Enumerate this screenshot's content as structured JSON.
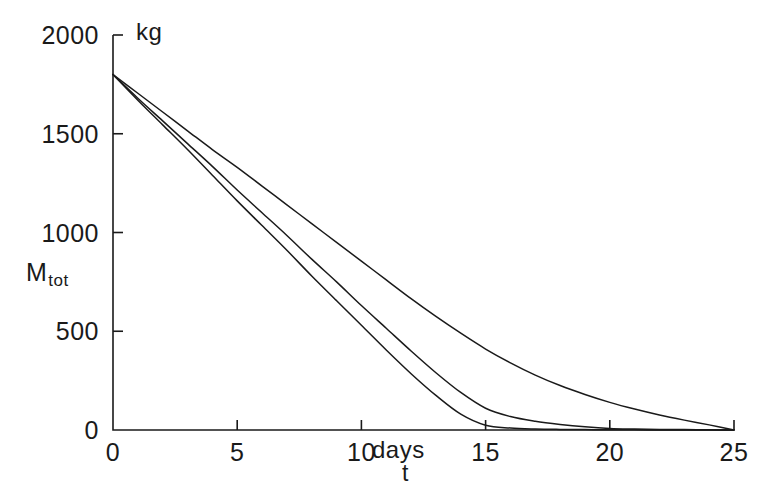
{
  "chart_data": {
    "type": "line",
    "title": "",
    "subtitle": "",
    "xlabel": "t",
    "ylabel": "M_tot",
    "x_unit": "days",
    "y_unit": "kg",
    "xlim": [
      0,
      25
    ],
    "ylim": [
      0,
      2000
    ],
    "x_ticks": [
      0,
      5,
      10,
      15,
      20,
      25
    ],
    "x_tick_labels": [
      "0",
      "5",
      "10",
      "15",
      "20",
      "25"
    ],
    "y_ticks": [
      0,
      500,
      1000,
      1500,
      2000
    ],
    "y_tick_labels": [
      "0",
      "500",
      "1000",
      "1500",
      "2000"
    ],
    "grid": false,
    "legend": "none",
    "line_color": "#1a1a1a",
    "background": "#ffffff",
    "series": [
      {
        "name": "curve-1-slowest",
        "x": [
          0,
          1,
          2,
          3,
          4,
          5,
          6,
          7,
          8,
          9,
          10,
          11,
          12,
          13,
          14,
          15,
          16,
          17,
          18,
          19,
          20,
          21,
          22,
          23,
          24,
          25
        ],
        "values": [
          1800,
          1705,
          1610,
          1515,
          1420,
          1330,
          1235,
          1140,
          1045,
          950,
          855,
          760,
          665,
          575,
          490,
          410,
          340,
          278,
          225,
          180,
          140,
          106,
          76,
          50,
          26,
          0
        ]
      },
      {
        "name": "curve-2-middle",
        "x": [
          0,
          1,
          2,
          3,
          4,
          5,
          6,
          7,
          8,
          9,
          10,
          11,
          12,
          13,
          14,
          15,
          16,
          17,
          18,
          19,
          20,
          21,
          22,
          23,
          24,
          25
        ],
        "values": [
          1800,
          1680,
          1565,
          1450,
          1335,
          1215,
          1100,
          985,
          865,
          750,
          630,
          515,
          400,
          290,
          190,
          110,
          68,
          44,
          28,
          16,
          8,
          5,
          3,
          2,
          1,
          0
        ]
      },
      {
        "name": "curve-3-fastest",
        "x": [
          0,
          1,
          2,
          3,
          4,
          5,
          6,
          7,
          8,
          9,
          10,
          11,
          12,
          13,
          14,
          15,
          16,
          17,
          18,
          19,
          20,
          21,
          22,
          23,
          24,
          25
        ],
        "values": [
          1800,
          1670,
          1545,
          1420,
          1290,
          1160,
          1035,
          910,
          780,
          655,
          530,
          405,
          285,
          175,
          80,
          24,
          10,
          5,
          3,
          2,
          1,
          1,
          0,
          0,
          0,
          0
        ]
      }
    ]
  },
  "axis": {
    "y_unit_label": "kg",
    "x_unit_label": "days",
    "y_name_base": "M",
    "y_name_sub": "tot",
    "x_name": "t"
  }
}
